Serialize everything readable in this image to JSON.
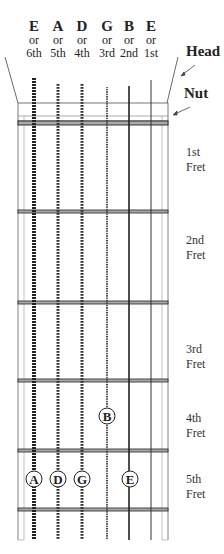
{
  "strings": [
    {
      "note": "E",
      "or": "or",
      "num": "6th",
      "x": 34
    },
    {
      "note": "A",
      "or": "or",
      "num": "5th",
      "x": 58
    },
    {
      "note": "D",
      "or": "or",
      "num": "4th",
      "x": 82
    },
    {
      "note": "G",
      "or": "or",
      "num": "3rd",
      "x": 107
    },
    {
      "note": "B",
      "or": "or",
      "num": "2nd",
      "x": 129
    },
    {
      "note": "E",
      "or": "or",
      "num": "1st",
      "x": 151
    }
  ],
  "labels": {
    "head": "Head",
    "nut": "Nut"
  },
  "frets": [
    {
      "line1": "1st",
      "line2": "Fret"
    },
    {
      "line1": "2nd",
      "line2": "Fret"
    },
    {
      "line1": "3rd",
      "line2": "Fret"
    },
    {
      "line1": "4th",
      "line2": "Fret"
    },
    {
      "line1": "5th",
      "line2": "Fret"
    }
  ],
  "notes": [
    {
      "label": "B",
      "string": "3rd",
      "fret": "4th"
    },
    {
      "label": "A",
      "string": "6th",
      "fret": "5th"
    },
    {
      "label": "D",
      "string": "5th",
      "fret": "5th"
    },
    {
      "label": "G",
      "string": "4th",
      "fret": "5th"
    },
    {
      "label": "E",
      "string": "2nd",
      "fret": "5th"
    }
  ]
}
